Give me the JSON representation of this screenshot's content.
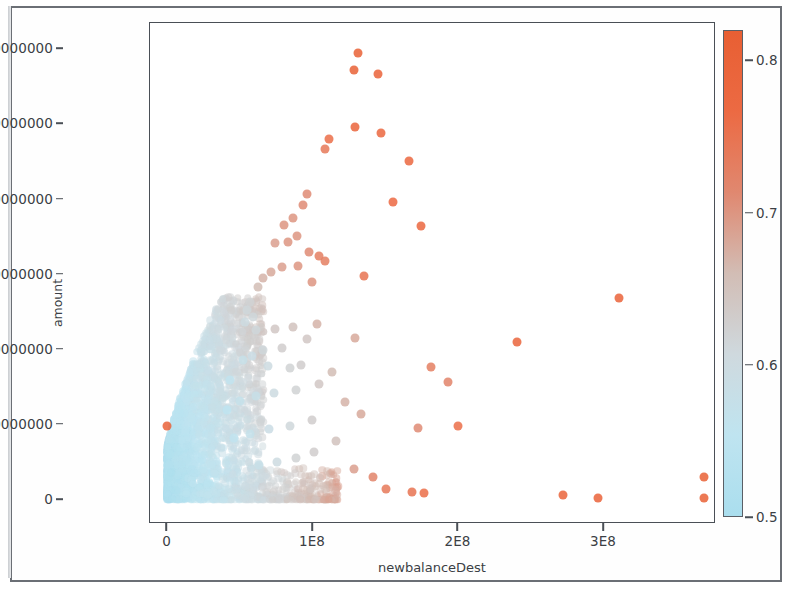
{
  "chart_data": {
    "type": "scatter",
    "title": "",
    "xlabel": "newbalanceDest",
    "ylabel": "amount",
    "xlim": [
      -12000000,
      377000000
    ],
    "ylim": [
      -3200000,
      63500000
    ],
    "xticks": [
      0,
      100000000,
      200000000,
      300000000
    ],
    "xticklabels": [
      "0",
      "1E8",
      "2E8",
      "3E8"
    ],
    "yticks": [
      0,
      10000000,
      20000000,
      30000000,
      40000000,
      50000000,
      60000000
    ],
    "yticklabels": [
      "0",
      "10000000",
      "20000000",
      "30000000",
      "40000000",
      "50000000",
      "60000000"
    ],
    "grid": false,
    "legend": "none",
    "colorbar": {
      "label": "_Anomaly_",
      "vmin": 0.5,
      "vmax": 0.82,
      "ticks": [
        0.5,
        0.6,
        0.7,
        0.8
      ],
      "ticklabels": [
        "0.5",
        "0.6",
        "0.7",
        "0.8"
      ],
      "colormap_stops": [
        "#aadeee",
        "#bfe4f0",
        "#cfd9de",
        "#d2bdb5",
        "#e08870",
        "#ec6a43",
        "#e85f33"
      ],
      "position": "right"
    },
    "marker": {
      "shape": "circle",
      "size": 9,
      "opacity": 0.85
    },
    "point_color_metric": "_Anomaly_",
    "series": [
      {
        "name": "transactions",
        "points": [
          {
            "x": 0,
            "y": 9900000,
            "c": 0.8
          },
          {
            "x": 131000000,
            "y": 59500000,
            "c": 0.81
          },
          {
            "x": 128000000,
            "y": 57200000,
            "c": 0.81
          },
          {
            "x": 145000000,
            "y": 56700000,
            "c": 0.8
          },
          {
            "x": 129000000,
            "y": 49600000,
            "c": 0.79
          },
          {
            "x": 147000000,
            "y": 48800000,
            "c": 0.78
          },
          {
            "x": 111000000,
            "y": 48100000,
            "c": 0.76
          },
          {
            "x": 108000000,
            "y": 46700000,
            "c": 0.74
          },
          {
            "x": 166000000,
            "y": 45100000,
            "c": 0.78
          },
          {
            "x": 155000000,
            "y": 39700000,
            "c": 0.77
          },
          {
            "x": 174000000,
            "y": 36500000,
            "c": 0.78
          },
          {
            "x": 96000000,
            "y": 40700000,
            "c": 0.71
          },
          {
            "x": 93000000,
            "y": 39300000,
            "c": 0.71
          },
          {
            "x": 86000000,
            "y": 37500000,
            "c": 0.7
          },
          {
            "x": 80000000,
            "y": 36600000,
            "c": 0.7
          },
          {
            "x": 89000000,
            "y": 35100000,
            "c": 0.7
          },
          {
            "x": 83000000,
            "y": 34300000,
            "c": 0.7
          },
          {
            "x": 74000000,
            "y": 34200000,
            "c": 0.69
          },
          {
            "x": 97000000,
            "y": 33000000,
            "c": 0.71
          },
          {
            "x": 104000000,
            "y": 32500000,
            "c": 0.73
          },
          {
            "x": 108000000,
            "y": 31800000,
            "c": 0.73
          },
          {
            "x": 90000000,
            "y": 31200000,
            "c": 0.7
          },
          {
            "x": 79000000,
            "y": 31000000,
            "c": 0.69
          },
          {
            "x": 71000000,
            "y": 30300000,
            "c": 0.68
          },
          {
            "x": 66000000,
            "y": 29500000,
            "c": 0.67
          },
          {
            "x": 62000000,
            "y": 28400000,
            "c": 0.66
          },
          {
            "x": 99000000,
            "y": 29000000,
            "c": 0.7
          },
          {
            "x": 135000000,
            "y": 29800000,
            "c": 0.75
          },
          {
            "x": 310000000,
            "y": 26900000,
            "c": 0.8
          },
          {
            "x": 240000000,
            "y": 21000000,
            "c": 0.79
          },
          {
            "x": 129000000,
            "y": 21500000,
            "c": 0.68
          },
          {
            "x": 181000000,
            "y": 17700000,
            "c": 0.73
          },
          {
            "x": 193000000,
            "y": 15700000,
            "c": 0.72
          },
          {
            "x": 172000000,
            "y": 9600000,
            "c": 0.71
          },
          {
            "x": 200000000,
            "y": 9800000,
            "c": 0.76
          },
          {
            "x": 57000000,
            "y": 26400000,
            "c": 0.62
          },
          {
            "x": 55000000,
            "y": 25300000,
            "c": 0.61
          },
          {
            "x": 59000000,
            "y": 24300000,
            "c": 0.61
          },
          {
            "x": 53000000,
            "y": 23700000,
            "c": 0.6
          },
          {
            "x": 61000000,
            "y": 22600000,
            "c": 0.61
          },
          {
            "x": 74000000,
            "y": 22700000,
            "c": 0.64
          },
          {
            "x": 86000000,
            "y": 23000000,
            "c": 0.65
          },
          {
            "x": 103000000,
            "y": 23400000,
            "c": 0.67
          },
          {
            "x": 96000000,
            "y": 21400000,
            "c": 0.64
          },
          {
            "x": 79000000,
            "y": 20200000,
            "c": 0.63
          },
          {
            "x": 66000000,
            "y": 20000000,
            "c": 0.61
          },
          {
            "x": 58000000,
            "y": 19200000,
            "c": 0.59
          },
          {
            "x": 52000000,
            "y": 18600000,
            "c": 0.58
          },
          {
            "x": 69000000,
            "y": 17800000,
            "c": 0.6
          },
          {
            "x": 84000000,
            "y": 17600000,
            "c": 0.62
          },
          {
            "x": 92000000,
            "y": 18000000,
            "c": 0.63
          },
          {
            "x": 113000000,
            "y": 17100000,
            "c": 0.66
          },
          {
            "x": 104000000,
            "y": 15400000,
            "c": 0.64
          },
          {
            "x": 88000000,
            "y": 14600000,
            "c": 0.62
          },
          {
            "x": 73000000,
            "y": 14200000,
            "c": 0.6
          },
          {
            "x": 61000000,
            "y": 13800000,
            "c": 0.58
          },
          {
            "x": 50000000,
            "y": 13200000,
            "c": 0.57
          },
          {
            "x": 43000000,
            "y": 16000000,
            "c": 0.56
          },
          {
            "x": 41000000,
            "y": 12000000,
            "c": 0.55
          },
          {
            "x": 122000000,
            "y": 13000000,
            "c": 0.67
          },
          {
            "x": 133000000,
            "y": 11500000,
            "c": 0.68
          },
          {
            "x": 99000000,
            "y": 10600000,
            "c": 0.63
          },
          {
            "x": 84000000,
            "y": 9800000,
            "c": 0.61
          },
          {
            "x": 70000000,
            "y": 9500000,
            "c": 0.59
          },
          {
            "x": 57000000,
            "y": 8800000,
            "c": 0.57
          },
          {
            "x": 46000000,
            "y": 8200000,
            "c": 0.56
          },
          {
            "x": 116000000,
            "y": 7800000,
            "c": 0.65
          },
          {
            "x": 101000000,
            "y": 6400000,
            "c": 0.63
          },
          {
            "x": 88000000,
            "y": 5600000,
            "c": 0.62
          },
          {
            "x": 75000000,
            "y": 5100000,
            "c": 0.6
          },
          {
            "x": 63000000,
            "y": 4700000,
            "c": 0.58
          },
          {
            "x": 128000000,
            "y": 4100000,
            "c": 0.69
          },
          {
            "x": 141000000,
            "y": 3000000,
            "c": 0.72
          },
          {
            "x": 150000000,
            "y": 1400000,
            "c": 0.74
          },
          {
            "x": 168000000,
            "y": 1100000,
            "c": 0.75
          },
          {
            "x": 176000000,
            "y": 900000,
            "c": 0.76
          },
          {
            "x": 272000000,
            "y": 700000,
            "c": 0.79
          },
          {
            "x": 296000000,
            "y": 200000,
            "c": 0.8
          },
          {
            "x": 369000000,
            "y": 3100000,
            "c": 0.81
          },
          {
            "x": 369000000,
            "y": 300000,
            "c": 0.81
          }
        ]
      }
    ]
  }
}
